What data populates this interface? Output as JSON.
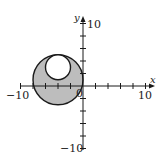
{
  "diagram": {
    "type": "coordinate-plane-region",
    "axes": {
      "x_label": "x",
      "y_label": "y",
      "x_min_label": "−10",
      "x_max_label": "10",
      "y_max_label": "10",
      "y_min_label": "−10",
      "origin_label": "0",
      "tick_spacing": 2,
      "range": [
        -10,
        10
      ]
    },
    "outer_circle": {
      "cx": -4,
      "cy": 1,
      "r": 4
    },
    "inner_circle": {
      "cx": -4,
      "cy": 3,
      "r": 2
    },
    "shading": {
      "fill": "#bdbdbd",
      "stroke": "#1a1a1a",
      "description": "region inside outer circle and outside inner circle is shaded"
    }
  }
}
